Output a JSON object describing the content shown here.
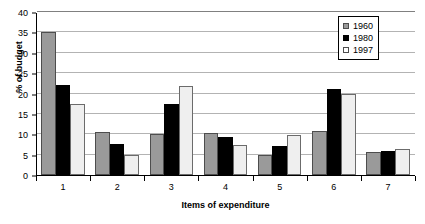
{
  "chart_data": {
    "type": "bar",
    "title": "",
    "xlabel": "Items of expenditure",
    "ylabel": "% of budget",
    "categories": [
      "1",
      "2",
      "3",
      "4",
      "5",
      "6",
      "7"
    ],
    "ylim": [
      0,
      40
    ],
    "ytick_labels": [
      "0",
      "5",
      "10",
      "15",
      "20",
      "25",
      "30",
      "35",
      "40"
    ],
    "ytick_values": [
      0,
      5,
      10,
      15,
      20,
      25,
      30,
      35,
      40
    ],
    "grid": true,
    "legend_position": "top-right",
    "series": [
      {
        "name": "1960",
        "color": "#9a9a9a",
        "values": [
          35.0,
          10.5,
          10.0,
          10.2,
          4.8,
          10.7,
          5.7
        ]
      },
      {
        "name": "1980",
        "color": "#000000",
        "values": [
          22.0,
          7.5,
          17.5,
          9.3,
          7.2,
          21.0,
          6.0
        ]
      },
      {
        "name": "1997",
        "color": "#efefef",
        "values": [
          17.4,
          5.0,
          21.8,
          7.3,
          9.8,
          20.0,
          6.5
        ]
      }
    ]
  }
}
